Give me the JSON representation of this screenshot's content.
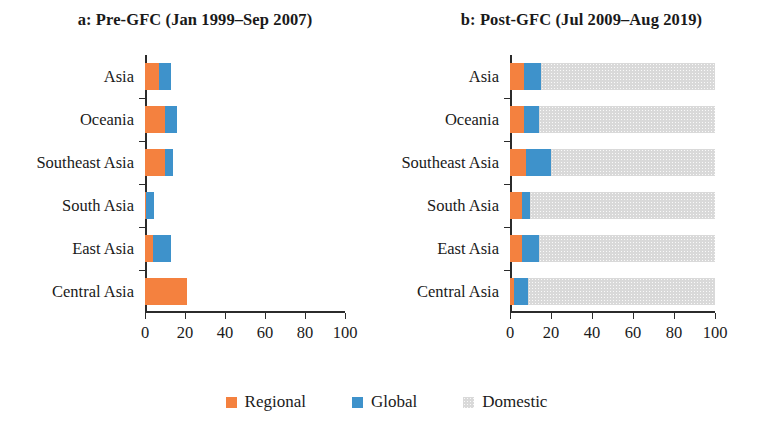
{
  "figure": {
    "width": 773,
    "height": 422
  },
  "legend": {
    "position": "bottom-center",
    "items": [
      {
        "label": "Regional",
        "color": "#f4813f"
      },
      {
        "label": "Global",
        "color": "#3e92cb"
      },
      {
        "label": "Domestic",
        "color": "#d9d9d9"
      }
    ]
  },
  "chart_data": [
    {
      "type": "bar",
      "orientation": "horizontal",
      "stacked": true,
      "panel": "a",
      "title": "a: Pre-GFC (Jan 1999–Sep 2007)",
      "xlabel": "",
      "ylabel": "",
      "xlim": [
        0,
        100
      ],
      "xticks": [
        0,
        20,
        40,
        60,
        80,
        100
      ],
      "xtick_labels": [
        "0",
        "20",
        "40",
        "60",
        "80",
        "100"
      ],
      "grid": false,
      "categories": [
        "Asia",
        "Oceania",
        "Southeast Asia",
        "South Asia",
        "East Asia",
        "Central Asia"
      ],
      "series": [
        {
          "name": "Regional",
          "color": "#f4813f",
          "values": [
            7,
            10,
            10,
            0.5,
            4,
            21
          ]
        },
        {
          "name": "Global",
          "color": "#3e92cb",
          "values": [
            6,
            6,
            4,
            4,
            9,
            0
          ]
        },
        {
          "name": "Domestic",
          "color": "#d9d9d9",
          "values": [
            0,
            0,
            0,
            0,
            0,
            0
          ]
        }
      ]
    },
    {
      "type": "bar",
      "orientation": "horizontal",
      "stacked": true,
      "panel": "b",
      "title": "b: Post-GFC (Jul 2009–Aug 2019)",
      "xlabel": "",
      "ylabel": "",
      "xlim": [
        0,
        100
      ],
      "xticks": [
        0,
        20,
        40,
        60,
        80,
        100
      ],
      "xtick_labels": [
        "0",
        "20",
        "40",
        "60",
        "80",
        "100"
      ],
      "grid": false,
      "categories": [
        "Asia",
        "Oceania",
        "Southeast Asia",
        "South Asia",
        "East Asia",
        "Central Asia"
      ],
      "series": [
        {
          "name": "Regional",
          "color": "#f4813f",
          "values": [
            7,
            7,
            8,
            6,
            6,
            2
          ]
        },
        {
          "name": "Global",
          "color": "#3e92cb",
          "values": [
            8,
            7,
            12,
            4,
            8,
            7
          ]
        },
        {
          "name": "Domestic",
          "color": "#d9d9d9",
          "values": [
            85,
            86,
            80,
            90,
            86,
            91
          ]
        }
      ]
    }
  ]
}
